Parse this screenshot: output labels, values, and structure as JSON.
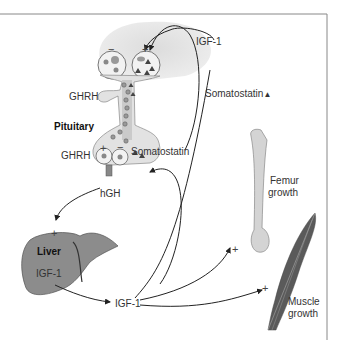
{
  "diagram": {
    "colors": {
      "hypothalamus_fill": "#e4e4e4",
      "pituitary_fill": "#e0e0e0",
      "liver_fill": "#8c8c8c",
      "bone_fill": "#d4d4d4",
      "muscle_fill": "#555555",
      "line": "#222222",
      "frame": "#888888"
    },
    "labels": {
      "igf1_top": "IGF-1",
      "somatostatin_right": "Somatostatin",
      "somatostatin_triangle": "▲",
      "ghrh_upper": "GHRH",
      "pituitary": "Pituitary",
      "ghrh_lower": "GHRH",
      "somatostatin_mid": "Somatostatin",
      "hgh": "hGH",
      "liver": "Liver",
      "liver_igf1": "IGF-1",
      "igf1_center": "IGF-1",
      "femur_line1": "Femur",
      "femur_line2": "growth",
      "muscle_line1": "Muscle",
      "muscle_line2": "growth"
    },
    "signs": {
      "hypo_minus": "−",
      "hypo_plus": "+",
      "pit_plus": "+",
      "pit_minus": "−",
      "liver_plus": "+",
      "femur_plus": "+",
      "muscle_plus": "+"
    }
  }
}
